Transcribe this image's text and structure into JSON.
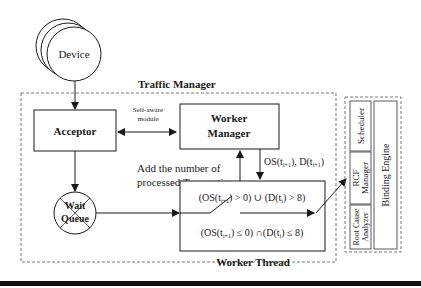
{
  "diagram": {
    "device": {
      "label": "Device"
    },
    "traffic_manager": {
      "label": "Traffic Manager"
    },
    "acceptor": {
      "label": "Acceptor"
    },
    "self_aware": {
      "line1": "Self-aware",
      "line2": "module"
    },
    "worker_manager": {
      "line1": "Worker",
      "line2": "Manager"
    },
    "feedback": {
      "line1": "Add the number of",
      "line2": "processed Transaction"
    },
    "os_d_label": {
      "os": "OS(t",
      "os_sub": "i+1",
      "sep": "), D(t",
      "d_sub": "i+1",
      "end": ")"
    },
    "wait_queue": {
      "line1": "Wait",
      "line2": "Queue"
    },
    "worker_thread": {
      "label": "Worker Thread",
      "cond_top": {
        "a": "(OS(t",
        "a_sub": "i+1",
        "b": ") > 0) ∪ (D(t",
        "b_sub": "i",
        "c": ") > 8)"
      },
      "cond_bottom": {
        "a": "(OS(t",
        "a_sub": "i+1",
        "b": ") ≤ 0) ∩(D(t",
        "b_sub": "i",
        "c": ") ≤ 8)"
      }
    },
    "binding_engine": {
      "label": "Binding Engine",
      "modules": [
        "Scheduler",
        "RCF Manager",
        "Root Cause Analyzer"
      ],
      "rcf_line1": "RCF",
      "rcf_line2": "Manager",
      "rca_line1": "Root Cause",
      "rca_line2": "Analyzer"
    }
  },
  "colors": {
    "stroke": "#1a1a1a",
    "dash": "#555555",
    "background": "#ffffff"
  }
}
